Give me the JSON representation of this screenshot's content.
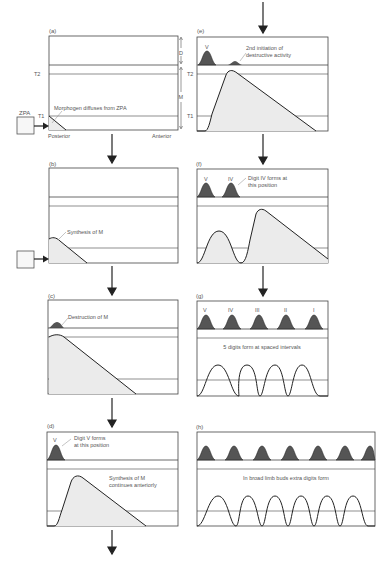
{
  "figure": {
    "colors": {
      "line": "#2a2a2a",
      "digit_fill": "#555555",
      "morphogen_fill": "#ebebeb",
      "border": "#444444"
    }
  },
  "panels": {
    "a": {
      "label": "(a)",
      "annotation": "Morphogen diffuses from ZPA",
      "zpa": "ZPA",
      "t1": "T1",
      "t2": "T2",
      "posterior": "Posterior",
      "anterior": "Anterior",
      "d_label": "D",
      "m_label": "M"
    },
    "b": {
      "label": "(b)",
      "annotation": "Synthesis of M"
    },
    "c": {
      "label": "(c)",
      "annotation": "Destruction of M"
    },
    "d": {
      "label": "(d)",
      "digit": "V",
      "annotation_1": "Digit V forms",
      "annotation_2": "at this position",
      "annotation_3": "Synthesis of M",
      "annotation_4": "continues anteriorly"
    },
    "e": {
      "label": "(e)",
      "digit": "V",
      "annotation_1": "2nd initiation of",
      "annotation_2": "destructive activity",
      "t1": "T1",
      "t2": "T2"
    },
    "f": {
      "label": "(f)",
      "digit_1": "V",
      "digit_2": "IV",
      "annotation_1": "Digit IV forms at",
      "annotation_2": "this position"
    },
    "g": {
      "label": "(g)",
      "digits": [
        "V",
        "IV",
        "III",
        "II",
        "I"
      ],
      "annotation": "5 digits form at spaced intervals"
    },
    "h": {
      "label": "(h)",
      "annotation": "In broad limb buds extra digits form"
    }
  }
}
